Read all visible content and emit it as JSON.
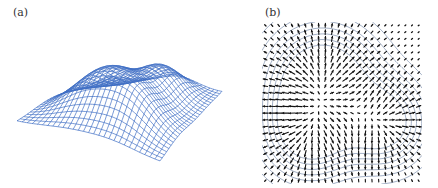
{
  "figure": {
    "panels": [
      {
        "id": "a",
        "label": "(a)",
        "kind": "3d-wireframe-surface",
        "description": "Blue wireframe mesh of a smooth surface with two peaks (bumps)",
        "mesh_color": "#3f6fc4",
        "grid_resolution": 28
      },
      {
        "id": "b",
        "label": "(b)",
        "kind": "vector-field-with-contours",
        "description": "Gradient vector field (black arrows) over contour lines (blue-gray) radiating from two sources",
        "arrow_color": "#111111",
        "contour_color": "#7d8fae",
        "grid_resolution": 24,
        "contour_levels": [
          0.05,
          0.1,
          0.16,
          0.23,
          0.31,
          0.4,
          0.5
        ]
      }
    ],
    "surface": {
      "sources": [
        {
          "name": "peak-1",
          "cx": 0.38,
          "cy": 0.38,
          "amplitude": 1.0,
          "sigma": 0.2
        },
        {
          "name": "peak-2",
          "cx": 0.75,
          "cy": 0.62,
          "amplitude": 0.75,
          "sigma": 0.16
        },
        {
          "name": "peak-3",
          "cx": 0.3,
          "cy": 0.68,
          "amplitude": 0.7,
          "sigma": 0.17
        }
      ]
    }
  }
}
